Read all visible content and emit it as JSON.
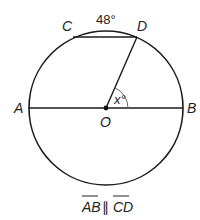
{
  "diagram": {
    "type": "circle-geometry",
    "circle": {
      "center_label": "O",
      "cx": 106,
      "cy": 108,
      "r": 77
    },
    "points": {
      "A": {
        "label": "A",
        "x": 29,
        "y": 108
      },
      "B": {
        "label": "B",
        "x": 183,
        "y": 108
      },
      "C": {
        "label": "C",
        "x": 73,
        "y": 37
      },
      "D": {
        "label": "D",
        "x": 137,
        "y": 37
      },
      "O": {
        "label": "O",
        "x": 106,
        "y": 108
      }
    },
    "segments": [
      "AB",
      "CD",
      "OD"
    ],
    "arc_label": {
      "text": "48°",
      "arc": "CD"
    },
    "angle_label": {
      "text": "x°",
      "angle": "DOB"
    },
    "caption": {
      "seg1": "AB",
      "parallel": "∥",
      "seg2": "CD"
    },
    "colors": {
      "stroke": "#1a1a1a",
      "text": "#222222"
    }
  }
}
